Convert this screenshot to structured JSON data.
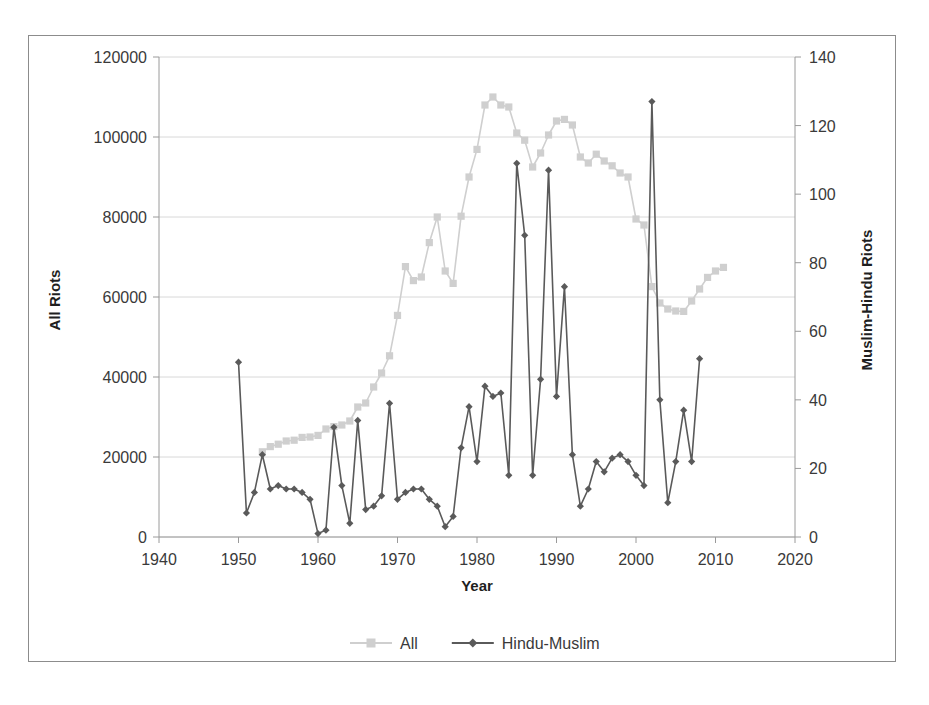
{
  "chart_data": {
    "type": "line",
    "title": "",
    "xlabel": "Year",
    "ylabel": "All Riots",
    "y2label": "Muslim-Hindu Riots",
    "xlim": [
      1940,
      2020
    ],
    "xticks": [
      1940,
      1950,
      1960,
      1970,
      1980,
      1990,
      2000,
      2010,
      2020
    ],
    "ylim": [
      0,
      120000
    ],
    "yticks": [
      0,
      20000,
      40000,
      60000,
      80000,
      100000,
      120000
    ],
    "y2lim": [
      0,
      140
    ],
    "y2ticks": [
      0,
      20,
      40,
      60,
      80,
      100,
      120,
      140
    ],
    "grid": true,
    "legend_position": "bottom",
    "series": [
      {
        "name": "All",
        "axis": "left",
        "color": "#cfcfcf",
        "marker": "square",
        "x": [
          1953,
          1954,
          1955,
          1956,
          1957,
          1958,
          1959,
          1960,
          1961,
          1962,
          1963,
          1964,
          1965,
          1966,
          1967,
          1968,
          1969,
          1970,
          1971,
          1972,
          1973,
          1974,
          1975,
          1976,
          1977,
          1978,
          1979,
          1980,
          1981,
          1982,
          1983,
          1984,
          1985,
          1986,
          1987,
          1988,
          1989,
          1990,
          1991,
          1992,
          1993,
          1994,
          1995,
          1996,
          1997,
          1998,
          1999,
          2000,
          2001,
          2002,
          2003,
          2004,
          2005,
          2006,
          2007,
          2008,
          2009,
          2010,
          2011
        ],
        "values": [
          21300,
          22600,
          23200,
          24000,
          24200,
          24900,
          25000,
          25400,
          27000,
          27600,
          28000,
          29000,
          32500,
          33500,
          37500,
          41000,
          45300,
          55400,
          67600,
          64100,
          65000,
          73600,
          80000,
          66500,
          63400,
          80200,
          90000,
          96900,
          108000,
          110000,
          108000,
          107500,
          101000,
          99200,
          92500,
          96000,
          100500,
          104000,
          104400,
          103000,
          95000,
          93500,
          95700,
          94000,
          92800,
          91000,
          90000,
          79500,
          78000,
          62600,
          58500,
          57000,
          56500,
          56400,
          59000,
          62000,
          64900,
          66500,
          67400
        ]
      },
      {
        "name": "Hindu-Muslim",
        "axis": "right",
        "color": "#5a5a5a",
        "marker": "diamond",
        "x": [
          1950,
          1951,
          1952,
          1953,
          1954,
          1955,
          1956,
          1957,
          1958,
          1959,
          1960,
          1961,
          1962,
          1963,
          1964,
          1965,
          1966,
          1967,
          1968,
          1969,
          1970,
          1971,
          1972,
          1973,
          1974,
          1975,
          1976,
          1977,
          1978,
          1979,
          1980,
          1981,
          1982,
          1983,
          1984,
          1985,
          1986,
          1987,
          1988,
          1989,
          1990,
          1991,
          1992,
          1993,
          1994,
          1995,
          1996,
          1997,
          1998,
          1999,
          2000,
          2001,
          2002,
          2003,
          2004,
          2005,
          2006,
          2007,
          2008
        ],
        "values": [
          51,
          7,
          13,
          24,
          14,
          15,
          14,
          14,
          13,
          11,
          1,
          2,
          32,
          15,
          4,
          34,
          8,
          9,
          12,
          39,
          11,
          13,
          14,
          14,
          11,
          9,
          3,
          6,
          26,
          38,
          22,
          44,
          41,
          42,
          18,
          109,
          88,
          18,
          46,
          107,
          41,
          73,
          24,
          9,
          14,
          22,
          19,
          23,
          24,
          22,
          18,
          15,
          127,
          40,
          10,
          22,
          37,
          22,
          52
        ]
      }
    ]
  },
  "axes": {
    "y_left": {
      "title": "All Riots",
      "ticks": [
        "0",
        "20000",
        "40000",
        "60000",
        "80000",
        "100000",
        "120000"
      ]
    },
    "y_right": {
      "title": "Muslim-Hindu Riots",
      "ticks": [
        "0",
        "20",
        "40",
        "60",
        "80",
        "100",
        "120",
        "140"
      ]
    },
    "x": {
      "title": "Year",
      "ticks": [
        "1940",
        "1950",
        "1960",
        "1970",
        "1980",
        "1990",
        "2000",
        "2010",
        "2020"
      ]
    }
  },
  "legend": {
    "items": [
      {
        "label": "All",
        "color": "#cfcfcf",
        "marker": "square"
      },
      {
        "label": "Hindu-Muslim",
        "color": "#5a5a5a",
        "marker": "diamond"
      }
    ]
  }
}
